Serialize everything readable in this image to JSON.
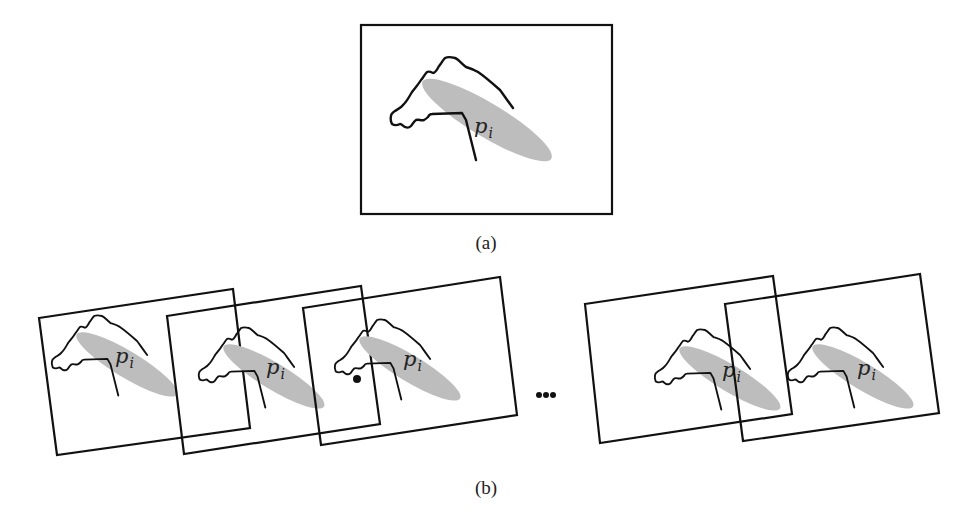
{
  "figure": {
    "panel_a": {
      "caption": "(a)",
      "frame": {
        "x": 361,
        "y": 25,
        "width": 251,
        "height": 189
      },
      "shape": {
        "x": 391,
        "y": 58,
        "scale": 1.0
      },
      "label": {
        "main": "p",
        "sub": "i"
      }
    },
    "panel_b": {
      "caption": "(b)",
      "ellipsis": "...",
      "frames": [
        {
          "points": "39,318 233,289 250,428 57,455",
          "shape": {
            "x": 52,
            "y": 316,
            "scale": 0.78
          },
          "label": {
            "main": "p",
            "sub": "i"
          },
          "marker": false
        },
        {
          "points": "167,316 361,286 380,424 184,454",
          "shape": {
            "x": 199,
            "y": 328,
            "scale": 0.78
          },
          "label": {
            "main": "p",
            "sub": "i"
          },
          "marker": false
        },
        {
          "points": "303,308 500,277 517,415 321,445",
          "shape": {
            "x": 335,
            "y": 320,
            "scale": 0.78
          },
          "label": {
            "main": "p",
            "sub": "i"
          },
          "marker": true
        },
        {
          "points": "585,304 773,276 792,414 600,443",
          "shape": {
            "x": 655,
            "y": 330,
            "scale": 0.78
          },
          "label": {
            "main": "p",
            "sub": "i"
          },
          "marker": false
        },
        {
          "points": "725,304 920,274 939,413 743,441",
          "shape": {
            "x": 788,
            "y": 328,
            "scale": 0.78
          },
          "label": {
            "main": "p",
            "sub": "i"
          },
          "marker": false
        }
      ]
    },
    "colors": {
      "stroke": "#111111",
      "blob_fill": "#bdbdbd",
      "background": "#ffffff"
    }
  }
}
